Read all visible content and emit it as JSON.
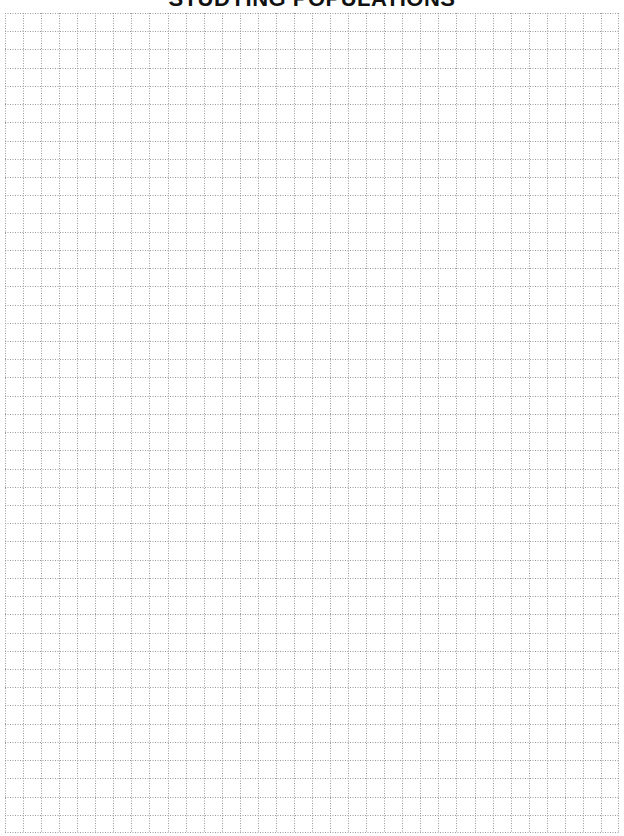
{
  "page": {
    "title": "STUDYING POPULATIONS"
  },
  "grid": {
    "columns": 34,
    "rows": 45,
    "line_color": "#9a9a9a",
    "line_style": "dotted",
    "background": "#ffffff"
  }
}
